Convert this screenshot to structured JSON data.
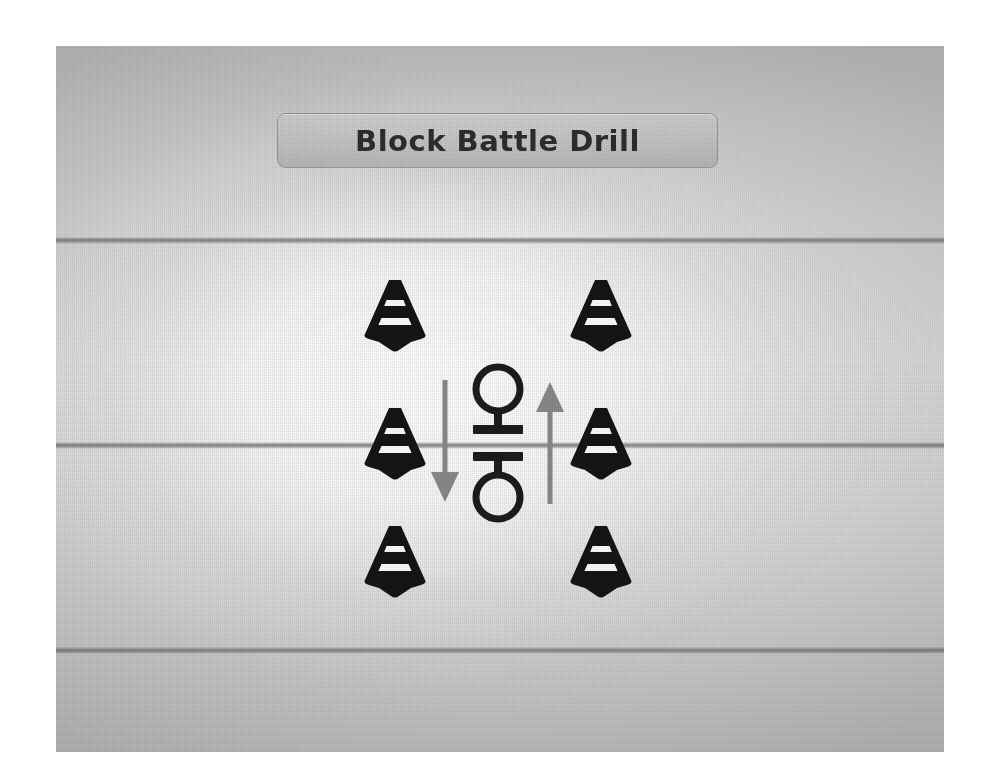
{
  "title": {
    "text": "Block Battle Drill"
  },
  "colors": {
    "ink": "#1c1c1c",
    "cone_body": "#151515",
    "cone_stripe": "#ffffff",
    "arrow": "#8a8a8a",
    "yard_line": "#8c8c8c",
    "plate_fill": "#cfcfcf",
    "plate_border": "#787878",
    "title_text": "#2f2f2f",
    "field_light": "#f2f2f2",
    "field_dark": "#c7c7c7",
    "page_background": "#ffffff"
  },
  "field": {
    "yard_lines": [
      {
        "name": "yard-line-top",
        "y": 191
      },
      {
        "name": "yard-line-middle",
        "y": 396
      },
      {
        "name": "yard-line-bottom",
        "y": 601
      }
    ]
  },
  "diagram": {
    "type": "drill-diagram",
    "cones": [
      {
        "id": "cone-top-left",
        "label": "Cone",
        "x": 339,
        "y": 268
      },
      {
        "id": "cone-top-right",
        "label": "Cone",
        "x": 545,
        "y": 268
      },
      {
        "id": "cone-middle-left",
        "label": "Cone",
        "x": 339,
        "y": 396
      },
      {
        "id": "cone-middle-right",
        "label": "Cone",
        "x": 545,
        "y": 396
      },
      {
        "id": "cone-bottom-left",
        "label": "Cone",
        "x": 339,
        "y": 514
      },
      {
        "id": "cone-bottom-right",
        "label": "Cone",
        "x": 545,
        "y": 514
      }
    ],
    "players": [
      {
        "id": "player-top",
        "label": "Player",
        "x": 442,
        "y": 357,
        "facing": "down"
      },
      {
        "id": "player-bottom",
        "label": "Player",
        "x": 442,
        "y": 437,
        "facing": "up"
      }
    ],
    "arrows": [
      {
        "id": "arrow-down-left",
        "label": "Movement down",
        "direction": "down",
        "x": 389,
        "y": 396
      },
      {
        "id": "arrow-up-right",
        "label": "Movement up",
        "direction": "up",
        "x": 494,
        "y": 396
      }
    ]
  }
}
